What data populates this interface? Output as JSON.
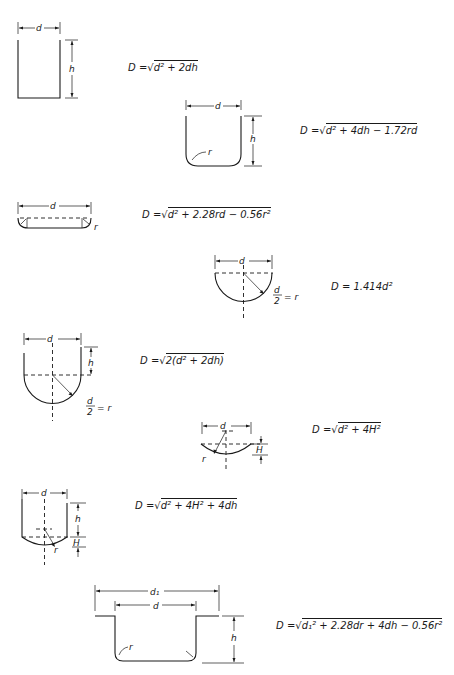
{
  "figures": [
    {
      "id": "cylinder-flat",
      "labels": {
        "d": "d",
        "h": "h"
      },
      "formula": "D = √(d² + 2dh)"
    },
    {
      "id": "cylinder-rounded-corner",
      "labels": {
        "d": "d",
        "h": "h",
        "r": "r"
      },
      "formula": "D = √(d² + 4dh − 1.72rd)"
    },
    {
      "id": "shallow-dish",
      "labels": {
        "d": "d",
        "r": "r"
      },
      "formula": "D = √(d² + 2.28rd − 0.56r²)"
    },
    {
      "id": "hemisphere",
      "labels": {
        "d": "d",
        "r_eq": "d/2 = r"
      },
      "formula": "D = 1.414d²"
    },
    {
      "id": "cylinder-hemispherical-bottom",
      "labels": {
        "d": "d",
        "h": "h",
        "r_eq": "d/2 = r"
      },
      "formula": "D = √(2(d² + 2dh))"
    },
    {
      "id": "spherical-segment",
      "labels": {
        "d": "d",
        "r": "r",
        "H": "H"
      },
      "formula": "D = √(d² + 4H²)"
    },
    {
      "id": "cylinder-segment-bottom",
      "labels": {
        "d": "d",
        "h": "h",
        "r": "r",
        "H": "H"
      },
      "formula": "D = √(d² + 4H² + 4dh)"
    },
    {
      "id": "flanged-cup",
      "labels": {
        "d1": "d₁",
        "d": "d",
        "h": "h",
        "r": "r"
      },
      "formula": "D = √(d₁² + 2.28dr + 4dh − 0.56r²)"
    }
  ],
  "formulas": {
    "f1": {
      "lhs": "D =",
      "rad": "d² + 2dh"
    },
    "f2": {
      "lhs": "D =",
      "rad": "d² + 4dh − 1.72rd"
    },
    "f3": {
      "lhs": "D =",
      "rad": "d² + 2.28rd − 0.56r²"
    },
    "f4": {
      "text": "D = 1.414d²"
    },
    "f5": {
      "lhs": "D =",
      "rad": "2(d² + 2dh)"
    },
    "f6": {
      "lhs": "D =",
      "rad": "d² + 4H²"
    },
    "f7": {
      "lhs": "D =",
      "rad": "d² + 4H² + 4dh"
    },
    "f8": {
      "lhs": "D =",
      "rad": "d₁² + 2.28dr + 4dh − 0.56r²"
    }
  },
  "labels": {
    "d": "d",
    "h": "h",
    "r": "r",
    "H": "H",
    "d1": "d₁",
    "r_eq": "= r",
    "half_num": "d",
    "half_den": "2"
  },
  "colors": {
    "ink": "#1a1a1a",
    "background": "#ffffff"
  }
}
